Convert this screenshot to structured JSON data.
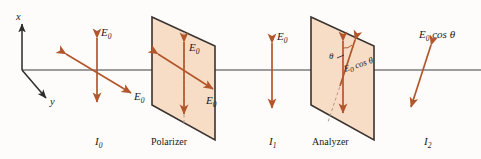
{
  "figure": {
    "colors": {
      "beam": "#b4562b",
      "plate_fill": "#f7ddc6",
      "plate_edge": "#3a3330",
      "axis_line": "#7d7d7d",
      "coord_axis": "#2b2b2b",
      "dashed_axis": "#b09a8a",
      "background": "#fdfcfa",
      "text": "#1a1a1a"
    },
    "coord_axes": {
      "x_label": "x",
      "y_label": "y"
    },
    "stages": [
      {
        "key": "incident",
        "intensity_label": "I",
        "intensity_sub": "0",
        "field_labels": [
          "E",
          "E"
        ],
        "field_subs": [
          "0",
          "0"
        ],
        "description": "unpolarized light, vertical and diagonal double arrows"
      },
      {
        "key": "polarizer",
        "name": "Polarizer",
        "field_labels": [
          "E",
          "E"
        ],
        "field_subs": [
          "0",
          "0"
        ],
        "description": "plate with vertical transmission axis"
      },
      {
        "key": "transmitted",
        "intensity_label": "I",
        "intensity_sub": "1",
        "field_labels": [
          "E"
        ],
        "field_subs": [
          "0"
        ],
        "description": "linearly polarized vertical double arrow"
      },
      {
        "key": "analyzer",
        "name": "Analyzer",
        "angle_label": "θ",
        "field_label": "E",
        "field_sub": "0",
        "field_suffix": "cos θ",
        "description": "plate with tilted transmission axis at angle theta"
      },
      {
        "key": "output",
        "intensity_label": "I",
        "intensity_sub": "2",
        "field_label": "E",
        "field_sub": "0",
        "field_suffix": "cos θ",
        "description": "tilted double arrow of reduced amplitude"
      }
    ]
  }
}
